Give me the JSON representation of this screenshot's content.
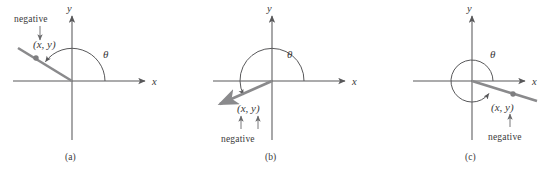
{
  "figure": {
    "panels": [
      {
        "id": "a",
        "caption": "(a)",
        "x_axis_label": "x",
        "y_axis_label": "y",
        "angle_label": "θ",
        "point_label": "(x, y)",
        "negative_label": "negative",
        "negative_targets": [
          "x"
        ],
        "quadrant": 2,
        "origin": [
          72,
          81
        ],
        "ray_end": [
          18,
          48
        ],
        "point_dot": [
          36,
          58
        ],
        "arrow_direction": "down"
      },
      {
        "id": "b",
        "caption": "(b)",
        "x_axis_label": "x",
        "y_axis_label": "y",
        "angle_label": "θ",
        "point_label": "(x, y)",
        "negative_label": "negative",
        "negative_targets": [
          "x",
          "y"
        ],
        "quadrant": 3,
        "origin": [
          89,
          81
        ],
        "ray_end": [
          34,
          106
        ],
        "point_dot": [
          52,
          98
        ],
        "arrow_direction": "up"
      },
      {
        "id": "c",
        "caption": "(c)",
        "x_axis_label": "x",
        "y_axis_label": "y",
        "angle_label": "θ",
        "point_label": "(x, y)",
        "negative_label": "negative",
        "negative_targets": [
          "y"
        ],
        "quadrant": 4,
        "origin": [
          107,
          81
        ],
        "ray_end": [
          170,
          100
        ],
        "point_dot": [
          148,
          94
        ],
        "arrow_direction": "up"
      }
    ],
    "colors": {
      "axis": "#58585a",
      "ray": "#8a8a8c",
      "text": "#3a3a3a",
      "background": "#ffffff"
    }
  }
}
